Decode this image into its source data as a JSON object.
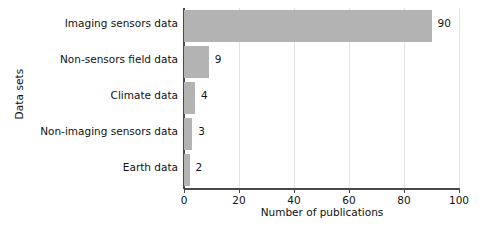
{
  "chart_data": {
    "type": "bar",
    "orientation": "horizontal",
    "title": "",
    "xlabel": "Number of publications",
    "ylabel": "Data sets",
    "categories": [
      "Imaging sensors data",
      "Non-sensors field data",
      "Climate data",
      "Non-imaging sensors data",
      "Earth data"
    ],
    "values": [
      90,
      9,
      4,
      3,
      2
    ],
    "value_labels": [
      "90",
      "9",
      "4",
      "3",
      "2"
    ],
    "xlim": [
      0,
      100
    ],
    "xticks": [
      0,
      20,
      40,
      60,
      80,
      100
    ],
    "xtick_labels": [
      "0",
      "20",
      "40",
      "60",
      "80",
      "100"
    ],
    "grid": "vertical",
    "legend": "none",
    "bar_color": "#b3b3b3",
    "axis_color": "#4a4a4a",
    "grid_color": "#e3e3e3",
    "background_color": "#ffffff"
  }
}
